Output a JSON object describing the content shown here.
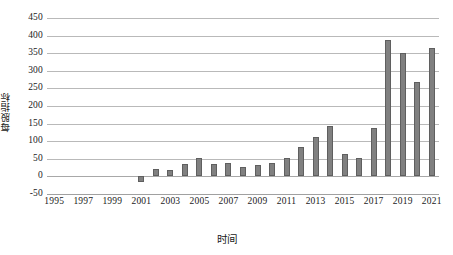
{
  "chart_data": {
    "type": "bar",
    "title": "",
    "xlabel": "时间",
    "ylabel": "每股指标",
    "categories": [
      "1995",
      "1996",
      "1997",
      "1998",
      "1999",
      "2000",
      "2001",
      "2002",
      "2003",
      "2004",
      "2005",
      "2006",
      "2007",
      "2008",
      "2009",
      "2010",
      "2011",
      "2012",
      "2013",
      "2014",
      "2015",
      "2016",
      "2017",
      "2018",
      "2019",
      "2020",
      "2021"
    ],
    "values": [
      0,
      0,
      0,
      0,
      0,
      0,
      -15,
      22,
      18,
      35,
      53,
      36,
      38,
      28,
      33,
      38,
      52,
      83,
      112,
      143,
      64,
      52,
      138,
      388,
      350,
      268,
      365
    ],
    "ylim": [
      -50,
      450
    ],
    "ytick_labels": [
      "450",
      "400",
      "350",
      "300",
      "250",
      "200",
      "150",
      "100",
      "50",
      "0",
      "-50"
    ],
    "ytick_values": [
      450,
      400,
      350,
      300,
      250,
      200,
      150,
      100,
      50,
      0,
      -50
    ],
    "xtick_labels": [
      "1995",
      "1997",
      "1999",
      "2001",
      "2003",
      "2005",
      "2007",
      "2009",
      "2011",
      "2013",
      "2015",
      "2017",
      "2019",
      "2021"
    ],
    "grid": true,
    "legend": false,
    "bar_color": "#808080",
    "bar_border_color": "#5f5f5f",
    "gridline_color": "#b9b9b9",
    "axis_text_color": "#1a1a1a"
  }
}
